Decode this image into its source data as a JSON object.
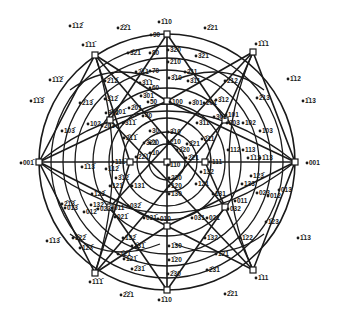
{
  "diagram": {
    "type": "stereographic projection",
    "center_pole": "110",
    "primitive_circle": {
      "cx": 167,
      "cy": 162,
      "r": 128
    },
    "angle_rings": [
      {
        "label": "10",
        "r": 18
      },
      {
        "label": "20",
        "r": 30
      },
      {
        "label": "30",
        "r": 44
      },
      {
        "label": "40",
        "r": 58
      },
      {
        "label": "50",
        "r": 74
      },
      {
        "label": "60",
        "r": 92
      },
      {
        "label": "70",
        "r": 104
      },
      {
        "label": "80",
        "r": 116
      },
      {
        "label": "90",
        "r": 128
      }
    ],
    "major_poles": [
      {
        "label": "1̄10",
        "x": 167,
        "y": 34
      },
      {
        "label": "001̄",
        "x": 39,
        "y": 162
      },
      {
        "label": "001",
        "x": 295,
        "y": 162
      },
      {
        "label": "1̄10",
        "x": 167,
        "y": 290
      },
      {
        "label": "1̄11̄",
        "x": 95,
        "y": 55
      },
      {
        "label": "1̄1̄1",
        "x": 253,
        "y": 52
      },
      {
        "label": "1̄1̄1̄",
        "x": 95,
        "y": 273
      },
      {
        "label": "1̄11",
        "x": 253,
        "y": 270
      },
      {
        "label": "101̄",
        "x": 110,
        "y": 120
      },
      {
        "label": "101",
        "x": 225,
        "y": 120
      },
      {
        "label": "011̄",
        "x": 110,
        "y": 207
      },
      {
        "label": "011",
        "x": 225,
        "y": 207
      },
      {
        "label": "100",
        "x": 167,
        "y": 101
      },
      {
        "label": "010",
        "x": 167,
        "y": 226
      },
      {
        "label": "111̄",
        "x": 130,
        "y": 162
      },
      {
        "label": "111",
        "x": 205,
        "y": 162
      },
      {
        "label": "110",
        "x": 167,
        "y": 162
      }
    ],
    "labels": [
      {
        "t": "90",
        "x": 153,
        "y": 37
      },
      {
        "t": "80",
        "x": 152,
        "y": 55
      },
      {
        "t": "70",
        "x": 152,
        "y": 73
      },
      {
        "t": "60",
        "x": 152,
        "y": 90
      },
      {
        "t": "50",
        "x": 150,
        "y": 104
      },
      {
        "t": "40",
        "x": 145,
        "y": 118
      },
      {
        "t": "30",
        "x": 152,
        "y": 133
      },
      {
        "t": "20",
        "x": 152,
        "y": 145
      },
      {
        "t": "10",
        "x": 152,
        "y": 155
      },
      {
        "t": "3̄20",
        "x": 170,
        "y": 52
      },
      {
        "t": "2̄10",
        "x": 170,
        "y": 64
      },
      {
        "t": "3̄10",
        "x": 171,
        "y": 80
      },
      {
        "t": "100",
        "x": 172,
        "y": 104
      },
      {
        "t": "3̄10",
        "x": 170,
        "y": 134
      },
      {
        "t": "2̄10",
        "x": 170,
        "y": 144
      },
      {
        "t": "3̄20",
        "x": 179,
        "y": 152
      },
      {
        "t": "110",
        "x": 170,
        "y": 167
      },
      {
        "t": "230",
        "x": 171,
        "y": 180
      },
      {
        "t": "120",
        "x": 171,
        "y": 188
      },
      {
        "t": "130",
        "x": 171,
        "y": 196
      },
      {
        "t": "010",
        "x": 160,
        "y": 221
      },
      {
        "t": "1̄30",
        "x": 171,
        "y": 248
      },
      {
        "t": "1̄20",
        "x": 171,
        "y": 262
      },
      {
        "t": "2̄30",
        "x": 170,
        "y": 276
      },
      {
        "t": "1̄10",
        "x": 161,
        "y": 302
      },
      {
        "t": "1̄10",
        "x": 161,
        "y": 24
      },
      {
        "t": "2̄2̄1",
        "x": 120,
        "y": 30
      },
      {
        "t": "2̄21",
        "x": 207,
        "y": 30
      },
      {
        "t": "3̄2̄1",
        "x": 130,
        "y": 55
      },
      {
        "t": "3̄21",
        "x": 198,
        "y": 58
      },
      {
        "t": "2̄1̄1",
        "x": 138,
        "y": 74
      },
      {
        "t": "2̄11",
        "x": 187,
        "y": 74
      },
      {
        "t": "3̄1̄1",
        "x": 142,
        "y": 85
      },
      {
        "t": "3̄11",
        "x": 190,
        "y": 83
      },
      {
        "t": "3̄01",
        "x": 143,
        "y": 98
      },
      {
        "t": "3̄01",
        "x": 192,
        "y": 105
      },
      {
        "t": "2̄01",
        "x": 131,
        "y": 110
      },
      {
        "t": "201",
        "x": 206,
        "y": 105
      },
      {
        "t": "3̄02",
        "x": 108,
        "y": 115
      },
      {
        "t": "302",
        "x": 216,
        "y": 119
      },
      {
        "t": "101̄",
        "x": 115,
        "y": 114
      },
      {
        "t": "101",
        "x": 228,
        "y": 117
      },
      {
        "t": "203",
        "x": 104,
        "y": 128
      },
      {
        "t": "203",
        "x": 229,
        "y": 125
      },
      {
        "t": "102",
        "x": 90,
        "y": 126
      },
      {
        "t": "102",
        "x": 245,
        "y": 125
      },
      {
        "t": "103̄",
        "x": 64,
        "y": 133
      },
      {
        "t": "103",
        "x": 262,
        "y": 133
      },
      {
        "t": "2̄13̄",
        "x": 82,
        "y": 105
      },
      {
        "t": "2̄13",
        "x": 259,
        "y": 100
      },
      {
        "t": "2̄12̄",
        "x": 107,
        "y": 83
      },
      {
        "t": "2̄12",
        "x": 227,
        "y": 83
      },
      {
        "t": "3̄12̄",
        "x": 107,
        "y": 101
      },
      {
        "t": "3̄12",
        "x": 218,
        "y": 102
      },
      {
        "t": "3̄1̄1̄",
        "x": 125,
        "y": 125
      },
      {
        "t": "3̄11",
        "x": 199,
        "y": 125
      },
      {
        "t": "2̄1̄1̄",
        "x": 126,
        "y": 140
      },
      {
        "t": "2̄11",
        "x": 204,
        "y": 141
      },
      {
        "t": "3̄2̄1̄",
        "x": 146,
        "y": 145
      },
      {
        "t": "3̄21",
        "x": 189,
        "y": 146
      },
      {
        "t": "2̄2̄1̄",
        "x": 138,
        "y": 159
      },
      {
        "t": "2̄21",
        "x": 188,
        "y": 160
      },
      {
        "t": "1̄12̄",
        "x": 72,
        "y": 28
      },
      {
        "t": "1̄1̄2̄",
        "x": 52,
        "y": 82
      },
      {
        "t": "1̄1̄3̄",
        "x": 33,
        "y": 103
      },
      {
        "t": "1̄12",
        "x": 290,
        "y": 81
      },
      {
        "t": "1̄13",
        "x": 305,
        "y": 103
      },
      {
        "t": "1̄11̄",
        "x": 85,
        "y": 47
      },
      {
        "t": "1̄1̄1",
        "x": 258,
        "y": 46
      },
      {
        "t": "001̄",
        "x": 23,
        "y": 165
      },
      {
        "t": "001",
        "x": 309,
        "y": 165
      },
      {
        "t": "1̄13̄",
        "x": 84,
        "y": 169
      },
      {
        "t": "1̄12̄",
        "x": 108,
        "y": 171
      },
      {
        "t": "1̄12",
        "x": 250,
        "y": 160
      },
      {
        "t": "1̄13",
        "x": 262,
        "y": 160
      },
      {
        "t": "111̄",
        "x": 115,
        "y": 164
      },
      {
        "t": "111",
        "x": 212,
        "y": 164
      },
      {
        "t": "3̄1̄2̄",
        "x": 118,
        "y": 180
      },
      {
        "t": "123̄",
        "x": 253,
        "y": 178
      },
      {
        "t": "2̄1̄3̄",
        "x": 64,
        "y": 206
      },
      {
        "t": "013̄",
        "x": 67,
        "y": 210
      },
      {
        "t": "013",
        "x": 281,
        "y": 192
      },
      {
        "t": "012̄",
        "x": 86,
        "y": 214
      },
      {
        "t": "012",
        "x": 270,
        "y": 198
      },
      {
        "t": "023̄",
        "x": 100,
        "y": 211
      },
      {
        "t": "023",
        "x": 259,
        "y": 195
      },
      {
        "t": "011̄",
        "x": 114,
        "y": 210
      },
      {
        "t": "011",
        "x": 237,
        "y": 203
      },
      {
        "t": "032̄",
        "x": 130,
        "y": 208
      },
      {
        "t": "032",
        "x": 230,
        "y": 211
      },
      {
        "t": "021̄",
        "x": 117,
        "y": 219
      },
      {
        "t": "021",
        "x": 209,
        "y": 220
      },
      {
        "t": "031̄",
        "x": 146,
        "y": 220
      },
      {
        "t": "031",
        "x": 194,
        "y": 220
      },
      {
        "t": "123̄",
        "x": 94,
        "y": 196
      },
      {
        "t": "132̄",
        "x": 93,
        "y": 207
      },
      {
        "t": "121̄",
        "x": 112,
        "y": 188
      },
      {
        "t": "131̄",
        "x": 134,
        "y": 188
      },
      {
        "t": "121",
        "x": 198,
        "y": 186
      },
      {
        "t": "131",
        "x": 215,
        "y": 196
      },
      {
        "t": "132",
        "x": 203,
        "y": 174
      },
      {
        "t": "133",
        "x": 244,
        "y": 186
      },
      {
        "t": "1̄22̄",
        "x": 75,
        "y": 240
      },
      {
        "t": "1̄23̄",
        "x": 82,
        "y": 250
      },
      {
        "t": "1̄13̄",
        "x": 49,
        "y": 243
      },
      {
        "t": "1̄21̄",
        "x": 126,
        "y": 261
      },
      {
        "t": "1̄2̄1",
        "x": 120,
        "y": 256
      },
      {
        "t": "2̄31̄",
        "x": 134,
        "y": 271
      },
      {
        "t": "1̄32̄",
        "x": 125,
        "y": 240
      },
      {
        "t": "1̄31̄",
        "x": 134,
        "y": 248
      },
      {
        "t": "1̄32",
        "x": 207,
        "y": 240
      },
      {
        "t": "1̄22",
        "x": 242,
        "y": 240
      },
      {
        "t": "1̄23",
        "x": 268,
        "y": 224
      },
      {
        "t": "1̄13",
        "x": 300,
        "y": 240
      },
      {
        "t": "1̄21",
        "x": 218,
        "y": 256
      },
      {
        "t": "2̄31",
        "x": 209,
        "y": 272
      },
      {
        "t": "1̄1̄1̄",
        "x": 92,
        "y": 284
      },
      {
        "t": "1̄11",
        "x": 258,
        "y": 280
      },
      {
        "t": "2̄2̄1",
        "x": 123,
        "y": 297
      },
      {
        "t": "2̄21",
        "x": 227,
        "y": 296
      },
      {
        "t": "112",
        "x": 230,
        "y": 152
      },
      {
        "t": "113",
        "x": 245,
        "y": 152
      }
    ]
  }
}
